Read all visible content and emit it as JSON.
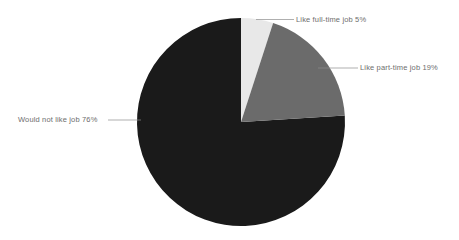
{
  "chart_data": {
    "type": "pie",
    "title": "",
    "subtitle": "",
    "xlabel": "",
    "ylabel": "",
    "grid": false,
    "legend_position": "none",
    "label_style": "external-with-leader-lines",
    "start_angle_deg": 0,
    "direction": "clockwise",
    "unit": "%",
    "categories": [
      "Like full-time job",
      "Like part-time job",
      "Would not like job"
    ],
    "values": [
      5,
      19,
      76
    ],
    "labels": [
      "Like full-time job 5%",
      "Like part-time job 19%",
      "Would not like job 76%"
    ],
    "colors": [
      "#e8e8e8",
      "#6b6b6b",
      "#1a1a1a"
    ],
    "slices": [
      {
        "name": "Like full-time job",
        "value": 5,
        "percent_text": "5%",
        "label": "Like full-time job 5%",
        "color": "#e8e8e8"
      },
      {
        "name": "Like part-time job",
        "value": 19,
        "percent_text": "19%",
        "label": "Like part-time job 19%",
        "color": "#6b6b6b"
      },
      {
        "name": "Would not like job",
        "value": 76,
        "percent_text": "76%",
        "label": "Would not like job 76%",
        "color": "#1a1a1a"
      }
    ],
    "total": 100
  },
  "style": {
    "background": "#ffffff",
    "leader_line_color": "#8c8c8c",
    "label_color": "#6e6e6e"
  }
}
